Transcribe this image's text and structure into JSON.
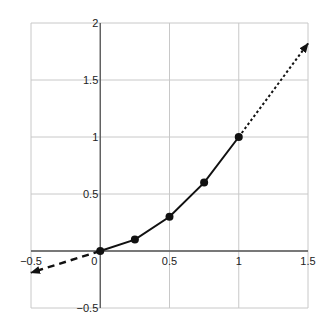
{
  "chart_data": {
    "type": "line",
    "title": "",
    "xlabel": "",
    "ylabel": "",
    "xlim": [
      -0.5,
      1.5
    ],
    "ylim": [
      -0.5,
      2
    ],
    "grid": true,
    "legend": null,
    "x_ticks": [
      "-0.5",
      "0",
      "0.5",
      "1",
      "1.5"
    ],
    "y_ticks": [
      "-0.5",
      "0.5",
      "1",
      "1.5",
      "2"
    ],
    "series": [
      {
        "name": "curve",
        "style": "solid",
        "markers": true,
        "x": [
          0,
          0.25,
          0.5,
          0.75,
          1
        ],
        "y": [
          0,
          0.1,
          0.3,
          0.6,
          1
        ]
      }
    ],
    "annotations": [
      {
        "type": "dashed-arrow",
        "from": [
          0,
          0
        ],
        "to": [
          -0.5,
          -0.19
        ]
      },
      {
        "type": "dotted-arrow",
        "from": [
          1,
          1
        ],
        "to": [
          1.5,
          1.82
        ]
      }
    ],
    "colors": {
      "line": "#111111",
      "grid": "#c8c8c8",
      "axis": "#555555"
    }
  }
}
